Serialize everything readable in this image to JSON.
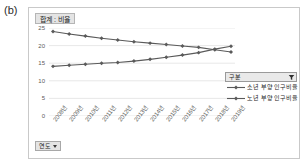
{
  "figure": {
    "label": "(b)"
  },
  "measure_chip": {
    "label": "합계 : 비율"
  },
  "legend": {
    "header_label": "구분",
    "filter_icon": "filter-icon",
    "items": [
      {
        "label": "소년 부양 인구비율",
        "color": "#5a5a5a",
        "marker": "diamond"
      },
      {
        "label": "노년 부양 인구비율",
        "color": "#5a5a5a",
        "marker": "diamond"
      }
    ]
  },
  "dimension_chip": {
    "label": "연도",
    "caret_icon": "chevron-down-icon"
  },
  "chart_data": {
    "type": "line",
    "title": "합계 : 비율",
    "xlabel": "",
    "ylabel": "",
    "ylim": [
      0,
      25
    ],
    "yticks": [
      0,
      5,
      10,
      15,
      20,
      25
    ],
    "grid": true,
    "legend_position": "right",
    "categories": [
      "2008년",
      "2009년",
      "2010년",
      "2011년",
      "2012년",
      "2013년",
      "2014년",
      "2015년",
      "2016년",
      "2017년",
      "2018년",
      "2019년"
    ],
    "series": [
      {
        "name": "소년 부양 인구비율",
        "color": "#5a5a5a",
        "values": [
          24.0,
          23.3,
          22.7,
          22.1,
          21.6,
          21.1,
          20.7,
          20.3,
          19.9,
          19.5,
          18.8,
          18.2
        ]
      },
      {
        "name": "노년 부양 인구비율",
        "color": "#5a5a5a",
        "values": [
          14.1,
          14.4,
          14.7,
          15.0,
          15.2,
          15.6,
          16.1,
          16.7,
          17.3,
          18.0,
          19.0,
          19.8
        ]
      }
    ]
  }
}
